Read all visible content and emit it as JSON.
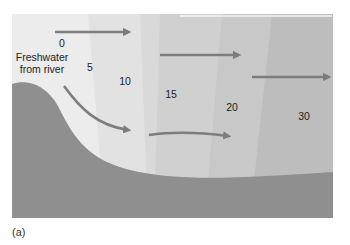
{
  "figure": {
    "caption": "(a)",
    "source_label_line1": "Freshwater",
    "source_label_line2": "from river",
    "salinity_labels": [
      "0",
      "5",
      "10",
      "15",
      "20",
      "30"
    ]
  },
  "colors": {
    "band_0": "#ececec",
    "band_1": "#e2e2e2",
    "band_2": "#d9d9d9",
    "band_3": "#d0d0d0",
    "band_4": "#c6c6c6",
    "band_5": "#bcbcbc",
    "seabed": "#8f8f8f",
    "arrow": "#7d7d7d",
    "surface_highlight": "#f6f6f6"
  }
}
